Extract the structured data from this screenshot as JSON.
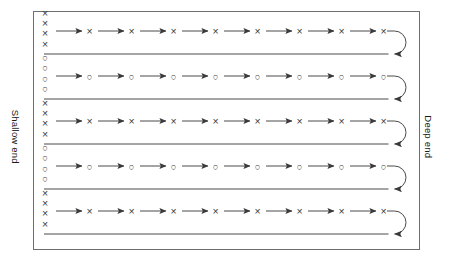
{
  "diagram": {
    "title_left": "Shallow end",
    "title_right": "Deep end",
    "background_color": "#ffffff",
    "line_color": "#4a4a4a",
    "border_color": "#6e6e6e",
    "marker_color": "#3a3a3a",
    "box": {
      "x": 33,
      "y": 11,
      "width": 387,
      "height": 239
    },
    "lane_count": 5,
    "arrows_per_lane": 8,
    "markers_per_group": 4,
    "marker_column_x": 45,
    "groups": [
      {
        "index": 1,
        "symbol": "x",
        "label": "X",
        "count": 4,
        "lane": 1
      },
      {
        "index": 2,
        "symbol": "o",
        "label": "O",
        "count": 4,
        "lane": 2
      },
      {
        "index": 3,
        "symbol": "x",
        "label": "X",
        "count": 4,
        "lane": 3
      },
      {
        "index": 4,
        "symbol": "o",
        "label": "O",
        "count": 4,
        "lane": 4
      },
      {
        "index": 5,
        "symbol": "x",
        "label": "X",
        "count": 4,
        "lane": 5
      }
    ],
    "lanes": [
      {
        "index": 1,
        "symbol": "x",
        "label": "X",
        "forward_y": 31,
        "return_y": 54,
        "turn_direction": "right-u-turn"
      },
      {
        "index": 2,
        "symbol": "o",
        "label": "O",
        "forward_y": 76,
        "return_y": 99,
        "turn_direction": "right-u-turn"
      },
      {
        "index": 3,
        "symbol": "x",
        "label": "X",
        "forward_y": 121,
        "return_y": 144,
        "turn_direction": "right-u-turn"
      },
      {
        "index": 4,
        "symbol": "o",
        "label": "O",
        "forward_y": 166,
        "return_y": 189,
        "turn_direction": "right-u-turn"
      },
      {
        "index": 5,
        "symbol": "x",
        "label": "X",
        "forward_y": 211,
        "return_y": 234,
        "turn_direction": "right-u-turn"
      }
    ]
  }
}
